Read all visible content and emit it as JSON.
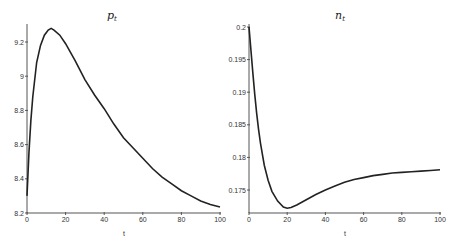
{
  "chart_data": [
    {
      "type": "line",
      "title": "p_t",
      "title_main": "p",
      "title_sub": "t",
      "xlabel": "t",
      "ylabel": "",
      "xlim": [
        0,
        100
      ],
      "ylim": [
        8.2,
        9.3
      ],
      "x_ticks": [
        0,
        20,
        40,
        60,
        80,
        100
      ],
      "y_ticks": [
        8.2,
        8.4,
        8.6,
        8.8,
        9,
        9.2
      ],
      "grid": false,
      "legend": null,
      "series": [
        {
          "name": "p_t",
          "x": [
            0,
            1,
            2,
            3,
            5,
            7,
            9,
            11,
            12.5,
            14,
            17,
            20,
            25,
            30,
            35,
            40,
            45,
            50,
            55,
            60,
            65,
            70,
            75,
            80,
            85,
            90,
            95,
            100
          ],
          "values": [
            8.3,
            8.55,
            8.74,
            8.88,
            9.08,
            9.18,
            9.24,
            9.27,
            9.28,
            9.27,
            9.24,
            9.19,
            9.09,
            8.98,
            8.89,
            8.81,
            8.72,
            8.64,
            8.58,
            8.52,
            8.46,
            8.41,
            8.37,
            8.33,
            8.3,
            8.27,
            8.25,
            8.235
          ]
        }
      ]
    },
    {
      "type": "line",
      "title": "n_t",
      "title_main": "n",
      "title_sub": "t",
      "xlabel": "t",
      "ylabel": "",
      "xlim": [
        0,
        100
      ],
      "ylim": [
        0.1715,
        0.2
      ],
      "x_ticks": [
        0,
        20,
        40,
        60,
        80,
        100
      ],
      "y_ticks": [
        0.175,
        0.18,
        0.185,
        0.19,
        0.195,
        0.2
      ],
      "y_tick_labels": [
        "0.175",
        "0.18",
        "0.185",
        "0.19",
        "0.195",
        "0.2"
      ],
      "grid": false,
      "legend": null,
      "series": [
        {
          "name": "n_t",
          "x": [
            0,
            1,
            2,
            3,
            4,
            5,
            6,
            8,
            10,
            12,
            15,
            18,
            20,
            22,
            25,
            30,
            35,
            40,
            45,
            50,
            55,
            60,
            65,
            70,
            75,
            80,
            85,
            90,
            95,
            100
          ],
          "values": [
            0.2,
            0.1965,
            0.193,
            0.1897,
            0.1868,
            0.1843,
            0.1822,
            0.1788,
            0.1765,
            0.1748,
            0.1733,
            0.1724,
            0.1722,
            0.1723,
            0.1727,
            0.1735,
            0.1743,
            0.175,
            0.1756,
            0.1762,
            0.1766,
            0.1769,
            0.1772,
            0.1774,
            0.1776,
            0.1777,
            0.1778,
            0.1779,
            0.178,
            0.1781
          ]
        }
      ]
    }
  ],
  "left": {
    "title_main": "p",
    "title_sub": "t",
    "xlabel": "t",
    "x_tick_labels": [
      "0",
      "20",
      "40",
      "60",
      "80",
      "100"
    ],
    "y_tick_labels": [
      "8.2",
      "8.4",
      "8.6",
      "8.8",
      "9",
      "9.2"
    ]
  },
  "right": {
    "title_main": "n",
    "title_sub": "t",
    "xlabel": "t",
    "x_tick_labels": [
      "0",
      "20",
      "40",
      "60",
      "80",
      "100"
    ],
    "y_tick_labels": [
      "0.175",
      "0.18",
      "0.185",
      "0.19",
      "0.195",
      "0.2"
    ]
  }
}
